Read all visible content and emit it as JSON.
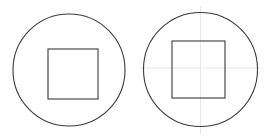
{
  "canvas": {
    "width": 269,
    "height": 140,
    "background_color": "#ffffff",
    "figure_count": 2
  },
  "style": {
    "stroke_color": "#3a3a3a",
    "stroke_width": 1.1,
    "guide_color": "#e6e6e6",
    "guide_width": 1,
    "fill": "none"
  },
  "figures": [
    {
      "id": "figure-left",
      "label": "circle-with-inscribed-square",
      "circle": {
        "cx": 69,
        "cy": 70,
        "r": 56
      },
      "square": {
        "x": 48,
        "y": 49,
        "width": 50,
        "height": 50
      },
      "guides": {
        "visible": false,
        "vertical_x": null,
        "horizontal_y": null
      }
    },
    {
      "id": "figure-right",
      "label": "circle-with-inscribed-square-and-crosshair",
      "circle": {
        "cx": 200.5,
        "cy": 69.5,
        "r": 57
      },
      "square": {
        "x": 172,
        "y": 41,
        "width": 53,
        "height": 57
      },
      "guides": {
        "visible": true,
        "vertical_x": 200.5,
        "vertical_y1": 6,
        "vertical_y2": 134,
        "horizontal_y": 68,
        "horizontal_x1": 140,
        "horizontal_x2": 262
      }
    }
  ]
}
